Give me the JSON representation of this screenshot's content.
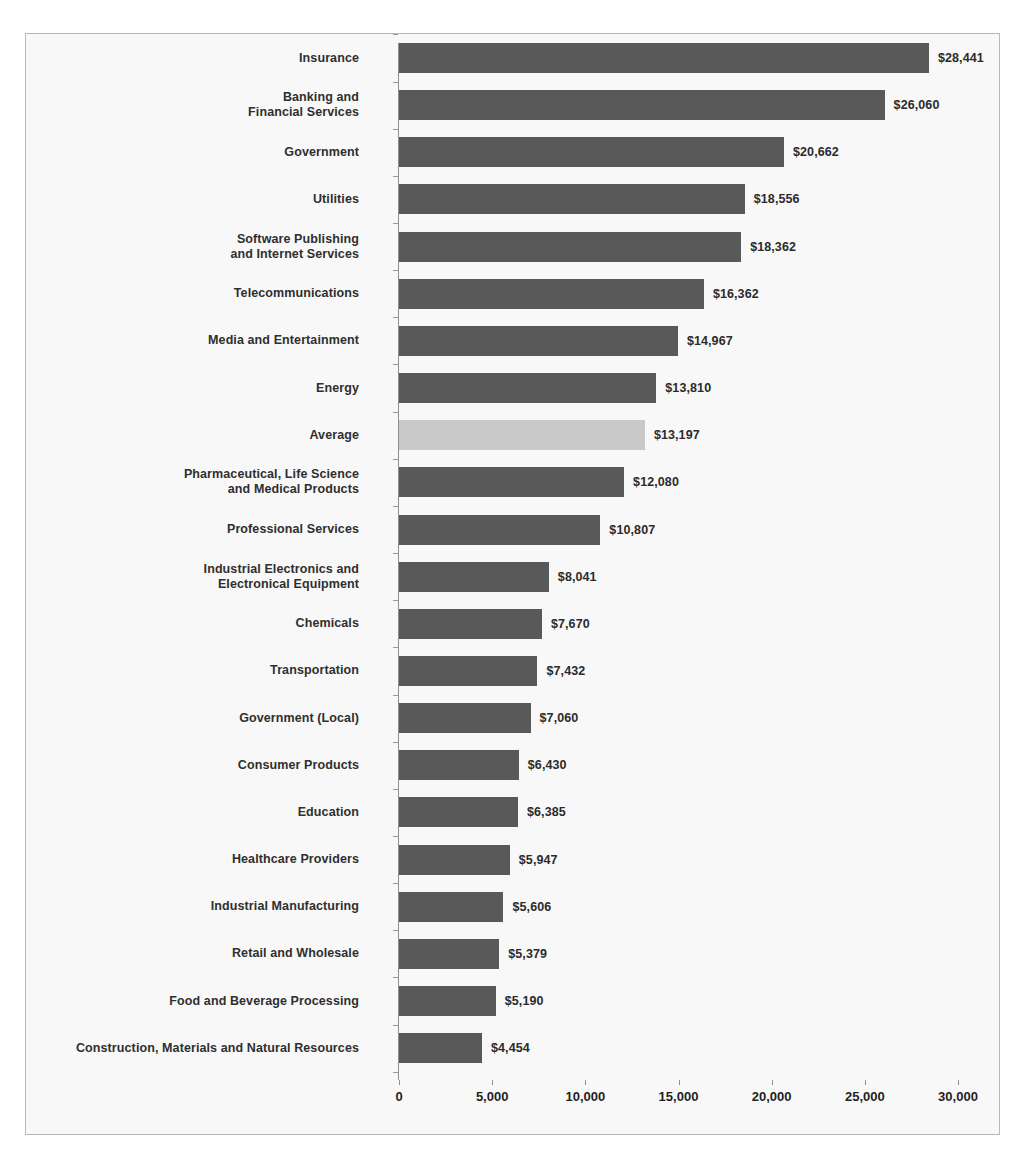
{
  "chart_data": {
    "type": "bar",
    "orientation": "horizontal",
    "title": "",
    "xlabel": "",
    "ylabel": "",
    "xlim": [
      0,
      30000
    ],
    "xticks": [
      0,
      5000,
      10000,
      15000,
      20000,
      25000,
      30000
    ],
    "xtick_labels": [
      "0",
      "5,000",
      "10,000",
      "15,000",
      "20,000",
      "25,000",
      "30,000"
    ],
    "grid": false,
    "legend": "none",
    "bar_color": "#595959",
    "highlight_color": "#c9c9c9",
    "highlight_category": "Average",
    "value_prefix": "$",
    "categories": [
      "Insurance",
      "Banking and\nFinancial Services",
      "Government",
      "Utilities",
      "Software Publishing\nand Internet Services",
      "Telecommunications",
      "Media and Entertainment",
      "Energy",
      "Average",
      "Pharmaceutical, Life Science\nand Medical Products",
      "Professional Services",
      "Industrial Electronics and\nElectronical Equipment",
      "Chemicals",
      "Transportation",
      "Government (Local)",
      "Consumer Products",
      "Education",
      "Healthcare Providers",
      "Industrial Manufacturing",
      "Retail and Wholesale",
      "Food and Beverage Processing",
      "Construction, Materials and Natural Resources"
    ],
    "values": [
      28441,
      26060,
      20662,
      18556,
      18362,
      16362,
      14967,
      13810,
      13197,
      12080,
      10807,
      8041,
      7670,
      7432,
      7060,
      6430,
      6385,
      5947,
      5606,
      5379,
      5190,
      4454
    ],
    "value_labels": [
      "$28,441",
      "$26,060",
      "$20,662",
      "$18,556",
      "$18,362",
      "$16,362",
      "$14,967",
      "$13,810",
      "$13,197",
      "$12,080",
      "$10,807",
      "$8,041",
      "$7,670",
      "$7,432",
      "$7,060",
      "$6,430",
      "$6,385",
      "$5,947",
      "$5,606",
      "$5,379",
      "$5,190",
      "$4,454"
    ]
  }
}
